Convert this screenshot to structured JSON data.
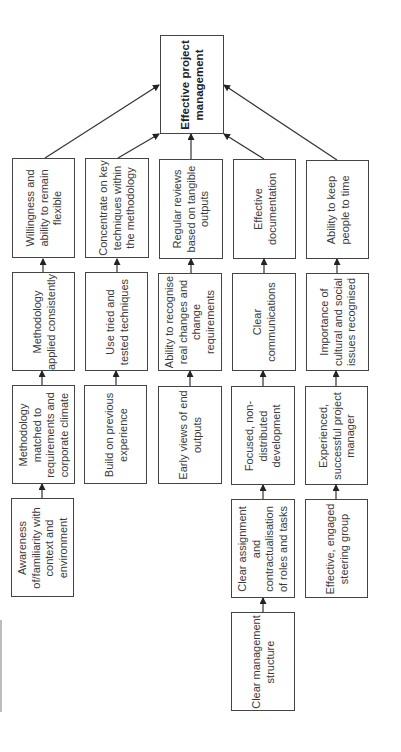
{
  "diagram": {
    "title": "Effective project management",
    "orientation": "rotated -90deg (text reads bottom-to-top)",
    "colors": {
      "stroke": "#444444",
      "text": "#3a3a3a",
      "background": "#ffffff"
    },
    "goal": {
      "label": "Effective project management"
    },
    "columns": [
      {
        "boxes": [
          "Willingness and ability to remain flexible",
          "Methodology applied consistently",
          "Methodology matched to requirements and corporate climate",
          "Awareness of/familiarity with context and environment"
        ]
      },
      {
        "boxes": [
          "Concentrate on key techniques within the methodology",
          "Use tried and tested techniques",
          "Build on previous experience"
        ]
      },
      {
        "boxes": [
          "Regular reviews based on tangible outputs",
          "Ability to recognise real changes and change requirements",
          "Early views of end outputs"
        ]
      },
      {
        "boxes": [
          "Effective documentation",
          "Clear communications",
          "Focused, non-distributed development",
          "Clear assignment and contractualisation of roles and tasks",
          "Clear management structure"
        ]
      },
      {
        "boxes": [
          "Ability to keep people to time",
          "Importance of cultural and social issues recognised",
          "Experienced, successful project manager",
          "Effective, engaged steering group"
        ]
      }
    ]
  }
}
